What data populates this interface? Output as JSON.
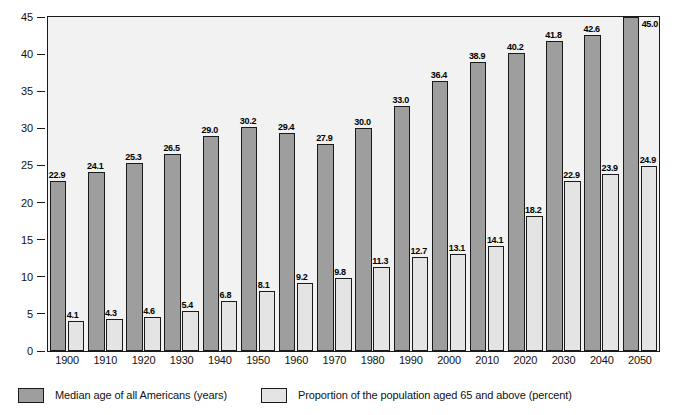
{
  "chart_data": {
    "type": "bar",
    "title": "",
    "subtitle": "",
    "xlabel": "",
    "ylabel": "",
    "ylim": [
      0,
      45
    ],
    "ytick_step": 5,
    "yticks": [
      "0",
      "5",
      "10",
      "15",
      "20",
      "25",
      "30",
      "35",
      "40",
      "45"
    ],
    "grid": false,
    "legend_position": "bottom-left",
    "categories": [
      "1900",
      "1910",
      "1920",
      "1930",
      "1940",
      "1950",
      "1960",
      "1970",
      "1980",
      "1990",
      "2000",
      "2010",
      "2020",
      "2030",
      "2040",
      "2050"
    ],
    "series": [
      {
        "name": "Median age of all Americans (years)",
        "color": "#9e9e9e",
        "values": [
          22.9,
          24.1,
          25.3,
          26.5,
          29.0,
          30.2,
          29.4,
          27.9,
          30.0,
          33.0,
          36.4,
          38.9,
          40.2,
          41.8,
          42.6,
          45.0
        ],
        "labels": [
          "22.9",
          "24.1",
          "25.3",
          "26.5",
          "29.0",
          "30.2",
          "29.4",
          "27.9",
          "30.0",
          "33.0",
          "36.4",
          "38.9",
          "40.2",
          "41.8",
          "42.6",
          "45.0"
        ]
      },
      {
        "name": "Proportion of the population aged 65 and above (percent)",
        "color": "#e4e4e4",
        "values": [
          4.1,
          4.3,
          4.6,
          5.4,
          6.8,
          8.1,
          9.2,
          9.8,
          11.3,
          12.7,
          13.1,
          14.1,
          18.2,
          22.9,
          23.9,
          24.9
        ],
        "labels": [
          "4.1",
          "4.3",
          "4.6",
          "5.4",
          "6.8",
          "8.1",
          "9.2",
          "9.8",
          "11.3",
          "12.7",
          "13.1",
          "14.1",
          "18.2",
          "22.9",
          "23.9",
          "24.9"
        ]
      }
    ]
  },
  "legend": {
    "items": [
      {
        "label": "Median age of all Americans (years)",
        "swatch": "dark"
      },
      {
        "label": "Proportion of the population aged 65 and above (percent)",
        "swatch": "light"
      }
    ]
  },
  "colors": {
    "dark_bar": "#9e9e9e",
    "light_bar": "#e4e4e4",
    "plot_background": "#f2f2f2",
    "axis": "#1a1a1a",
    "text": "#111111"
  }
}
